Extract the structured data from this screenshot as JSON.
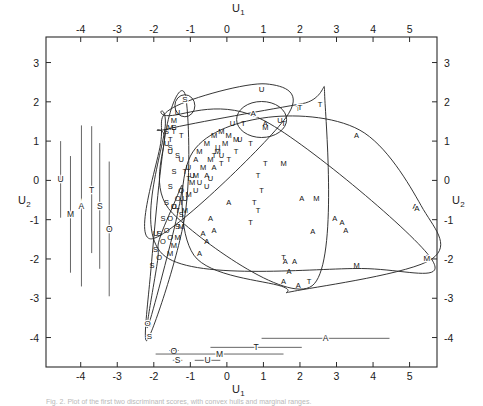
{
  "figure": {
    "type": "scatter",
    "xlabel": "U1",
    "ylabel": "U2",
    "xlabel_display": "U",
    "xlabel_sub": "1",
    "ylabel_display": "U",
    "ylabel_sub": "2",
    "caption": "Fig. 2.  Plot of the first two discriminant scores, with convex hulls and marginal ranges."
  },
  "axes": {
    "x_ticks": [
      "-4",
      "-3",
      "-2",
      "-1",
      "0",
      "1",
      "2",
      "3",
      "4",
      "5"
    ],
    "x_tick_values": [
      -4,
      -3,
      -2,
      -1,
      0,
      1,
      2,
      3,
      4,
      5
    ],
    "y_ticks": [
      "3",
      "2",
      "1",
      "0",
      "-1",
      "-2",
      "-3",
      "-4"
    ],
    "y_tick_values": [
      3,
      2,
      1,
      0,
      -1,
      -2,
      -3,
      -4
    ],
    "xlim": [
      -4.95,
      5.75
    ],
    "ylim": [
      -4.75,
      3.65
    ],
    "frame": true,
    "ticks_all_sides": true
  },
  "chart_data": {
    "type": "scatter",
    "title": "",
    "xlabel": "U1",
    "ylabel": "U2",
    "xlim": [
      -4.95,
      5.75
    ],
    "ylim": [
      -4.75,
      3.65
    ],
    "grid": false,
    "legend": "none",
    "point_marker": "group-letter",
    "groups": [
      "A",
      "M",
      "T",
      "U",
      "S",
      "O"
    ],
    "series": [
      {
        "name": "A",
        "label": "A",
        "points": [
          [
            3.55,
            1.15
          ],
          [
            5.15,
            -0.65
          ],
          [
            5.45,
            -1.95
          ],
          [
            2.35,
            -1.3
          ],
          [
            2.05,
            -0.45
          ],
          [
            2.95,
            -0.95
          ],
          [
            3.15,
            -1.05
          ],
          [
            3.25,
            -1.25
          ],
          [
            1.95,
            -2.65
          ],
          [
            1.7,
            -2.3
          ],
          [
            1.6,
            -2.05
          ],
          [
            1.85,
            -2.05
          ],
          [
            1.55,
            -2.55
          ],
          [
            1.05,
            1.45
          ],
          [
            0.05,
            -0.55
          ],
          [
            -0.35,
            -1.25
          ],
          [
            -0.55,
            -1.55
          ],
          [
            -0.65,
            -1.35
          ],
          [
            -0.45,
            -0.95
          ],
          [
            -0.75,
            -1.85
          ],
          [
            -0.35,
            0.35
          ],
          [
            -0.55,
            0.15
          ],
          [
            -0.85,
            0.55
          ]
        ]
      },
      {
        "name": "M",
        "label": "M",
        "points": [
          [
            1.55,
            0.45
          ],
          [
            2.45,
            -0.45
          ],
          [
            3.55,
            -2.15
          ],
          [
            5.45,
            -1.95
          ],
          [
            1.05,
            1.35
          ],
          [
            0.25,
            1.05
          ],
          [
            -0.05,
            0.95
          ],
          [
            -0.25,
            0.75
          ],
          [
            -0.45,
            0.55
          ],
          [
            -0.65,
            0.35
          ],
          [
            -0.85,
            0.15
          ],
          [
            -0.95,
            -0.05
          ],
          [
            -1.05,
            -0.35
          ],
          [
            -1.15,
            -0.75
          ],
          [
            -1.25,
            -1.15
          ],
          [
            -1.35,
            -1.45
          ],
          [
            -1.45,
            -1.65
          ],
          [
            -1.55,
            -1.85
          ],
          [
            -0.35,
            1.15
          ],
          [
            -0.15,
            1.25
          ],
          [
            0.05,
            1.15
          ],
          [
            -0.55,
            0.95
          ],
          [
            -0.75,
            0.75
          ],
          [
            -1.55,
            1.35
          ],
          [
            -1.45,
            1.55
          ]
        ]
      },
      {
        "name": "T",
        "label": "T",
        "points": [
          [
            1.55,
            -1.95
          ],
          [
            2.25,
            -2.55
          ],
          [
            0.65,
            0.95
          ],
          [
            1.05,
            0.45
          ],
          [
            0.85,
            0.15
          ],
          [
            0.95,
            -0.25
          ],
          [
            0.75,
            -0.55
          ],
          [
            0.85,
            -0.75
          ],
          [
            0.65,
            -1.05
          ],
          [
            1.95,
            1.85
          ],
          [
            1.55,
            1.45
          ],
          [
            0.45,
            1.45
          ],
          [
            0.25,
            0.75
          ],
          [
            0.05,
            0.55
          ],
          [
            -0.15,
            0.45
          ],
          [
            -0.35,
            0.65
          ],
          [
            -1.25,
            1.15
          ],
          [
            -1.45,
            1.25
          ],
          [
            -1.55,
            1.05
          ],
          [
            -1.25,
            -0.55
          ],
          [
            -1.35,
            -0.75
          ],
          [
            -1.15,
            0.25
          ],
          [
            -1.05,
            0.05
          ],
          [
            2.55,
            1.95
          ]
        ]
      },
      {
        "name": "U",
        "label": "U",
        "points": [
          [
            0.95,
            2.35
          ],
          [
            1.45,
            1.55
          ],
          [
            0.15,
            1.45
          ],
          [
            -1.35,
            1.75
          ],
          [
            -1.25,
            0.55
          ],
          [
            -1.05,
            0.35
          ],
          [
            -0.95,
            0.15
          ],
          [
            -0.75,
            -0.05
          ],
          [
            -0.85,
            -0.25
          ],
          [
            -1.15,
            -0.45
          ],
          [
            -1.45,
            -0.65
          ],
          [
            -1.95,
            -1.35
          ],
          [
            -0.55,
            -0.15
          ],
          [
            -0.45,
            0.05
          ],
          [
            0.35,
            1.05
          ],
          [
            -0.25,
            0.85
          ],
          [
            -0.15,
            0.65
          ],
          [
            -1.55,
            0.75
          ],
          [
            -1.65,
            0.95
          ]
        ]
      },
      {
        "name": "S",
        "label": "S",
        "points": [
          [
            -1.15,
            2.05
          ],
          [
            -1.45,
            1.35
          ],
          [
            -1.65,
            1.25
          ],
          [
            -1.55,
            0.85
          ],
          [
            -1.35,
            0.65
          ],
          [
            -1.45,
            0.25
          ],
          [
            -1.55,
            -0.15
          ],
          [
            -1.65,
            -0.55
          ],
          [
            -1.75,
            -0.95
          ],
          [
            -1.85,
            -1.35
          ],
          [
            -1.95,
            -1.75
          ],
          [
            -2.05,
            -2.15
          ],
          [
            -2.15,
            -3.95
          ],
          [
            -1.35,
            -1.15
          ],
          [
            -1.25,
            -0.85
          ]
        ]
      },
      {
        "name": "O",
        "label": "O",
        "points": [
          [
            -2.15,
            -3.65
          ],
          [
            -1.75,
            -1.55
          ],
          [
            -1.65,
            -1.25
          ],
          [
            -1.55,
            -0.95
          ],
          [
            -1.45,
            -0.65
          ],
          [
            -1.55,
            -1.45
          ],
          [
            -1.85,
            -1.95
          ],
          [
            -1.35,
            -0.45
          ],
          [
            -1.25,
            -0.25
          ]
        ]
      }
    ],
    "hulls": [
      {
        "name": "S",
        "label": "S",
        "label_x": -1.15,
        "label_y": 2.08
      },
      {
        "name": "U",
        "label": "U",
        "label_x": 0.95,
        "label_y": 2.33
      },
      {
        "name": "T",
        "label": "T",
        "label_x": 2.0,
        "label_y": 1.88
      },
      {
        "name": "A",
        "label": "A",
        "label_x": 0.72,
        "label_y": 1.72
      },
      {
        "name": "A2",
        "label": "A",
        "label_x": 5.2,
        "label_y": -0.7
      },
      {
        "name": "M",
        "label": "M",
        "label_x": 5.47,
        "label_y": -1.97
      },
      {
        "name": "O",
        "label": "O",
        "label_x": -2.17,
        "label_y": -3.62
      },
      {
        "name": "S2",
        "label": "S",
        "label_x": -2.12,
        "label_y": -3.97
      }
    ],
    "marginal_vertical": [
      {
        "label": "U",
        "x": -4.55,
        "y_min": -0.95,
        "y_max": 1.0
      },
      {
        "label": "M",
        "x": -4.28,
        "y_min": -2.35,
        "y_max": 0.62
      },
      {
        "label": "A",
        "x": -3.98,
        "y_min": -2.7,
        "y_max": 1.4
      },
      {
        "label": "T",
        "x": -3.7,
        "y_min": -1.85,
        "y_max": 1.38
      },
      {
        "label": "S",
        "x": -3.48,
        "y_min": -2.25,
        "y_max": 0.95
      },
      {
        "label": "O",
        "x": -3.22,
        "y_min": -2.95,
        "y_max": 0.48
      }
    ],
    "marginal_horizontal": [
      {
        "label": "A",
        "y": -4.02,
        "x_min": 0.95,
        "x_max": 4.45
      },
      {
        "label": "T",
        "y": -4.25,
        "x_min": -0.45,
        "x_max": 2.05
      },
      {
        "label": "O",
        "y": -4.33,
        "x_min": -1.58,
        "x_max": -1.32
      },
      {
        "label": "M",
        "y": -4.42,
        "x_min": -1.95,
        "x_max": 1.55
      },
      {
        "label": "S",
        "y": -4.58,
        "x_min": -1.48,
        "x_max": -1.22
      },
      {
        "label": "U",
        "y": -4.58,
        "x_min": -0.88,
        "x_max": -0.18
      }
    ]
  }
}
